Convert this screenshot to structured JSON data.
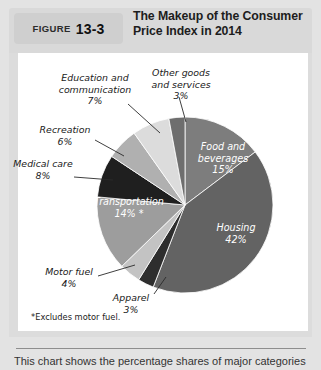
{
  "figure": {
    "label_word": "FIGURE",
    "number": "13-3",
    "title_line1": "The Makeup of the Consumer",
    "title_line2": "Price Index in 2014"
  },
  "footnote": "*Excludes motor fuel.",
  "caption": "This chart shows the percentage shares of major categories",
  "chart_data": {
    "type": "pie",
    "title": "The Makeup of the Consumer Price Index in 2014",
    "unit": "percent",
    "total": 100,
    "start_angle_deg": 0,
    "direction": "clockwise",
    "legend": "none",
    "categories": [
      "Food and beverages",
      "Housing",
      "Apparel",
      "Motor fuel",
      "Transportation",
      "Medical care",
      "Recreation",
      "Education and communication",
      "Other goods and services"
    ],
    "values": [
      15,
      42,
      3,
      4,
      14,
      8,
      6,
      7,
      3
    ],
    "colors": [
      "#7d7d7d",
      "#636363",
      "#2e2e2e",
      "#c3c3c3",
      "#9d9d9d",
      "#1f1f1f",
      "#b0b0b0",
      "#dcdcdc",
      "#6e6e6e"
    ],
    "slices": [
      {
        "name": "Food and beverages",
        "value": 15,
        "label": "Food and\nbeverages\n15%",
        "placement": "inside",
        "color": "#7d7d7d"
      },
      {
        "name": "Housing",
        "value": 42,
        "label": "Housing\n42%",
        "placement": "inside",
        "color": "#636363"
      },
      {
        "name": "Apparel",
        "value": 3,
        "label": "Apparel\n3%",
        "placement": "outside",
        "color": "#2e2e2e"
      },
      {
        "name": "Motor fuel",
        "value": 4,
        "label": "Motor fuel\n4%",
        "placement": "outside",
        "color": "#c3c3c3"
      },
      {
        "name": "Transportation",
        "value": 14,
        "label": "Transportation\n14% *",
        "placement": "inside",
        "color": "#9d9d9d"
      },
      {
        "name": "Medical care",
        "value": 8,
        "label": "Medical care\n8%",
        "placement": "outside",
        "color": "#1f1f1f"
      },
      {
        "name": "Recreation",
        "value": 6,
        "label": "Recreation\n6%",
        "placement": "outside",
        "color": "#b0b0b0"
      },
      {
        "name": "Education and communication",
        "value": 7,
        "label": "Education and\ncommunication\n7%",
        "placement": "outside",
        "color": "#dcdcdc"
      },
      {
        "name": "Other goods and services",
        "value": 3,
        "label": "Other goods\nand services\n3%",
        "placement": "outside",
        "color": "#6e6e6e"
      }
    ]
  }
}
